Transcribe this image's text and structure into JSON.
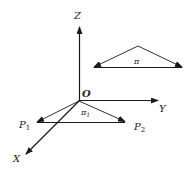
{
  "diagram": {
    "axes": {
      "z_label": "Z",
      "y_label": "Y",
      "x_label": "X",
      "origin_label": "O"
    },
    "plane_pi": {
      "label": "π"
    },
    "plane_pi1": {
      "label_main": "π",
      "label_sub": "1",
      "p1_main": "P",
      "p1_sub": "1",
      "p2_main": "P",
      "p2_sub": "2"
    },
    "colors": {
      "stroke": "#1a1a1a",
      "background": "#ffffff"
    }
  }
}
